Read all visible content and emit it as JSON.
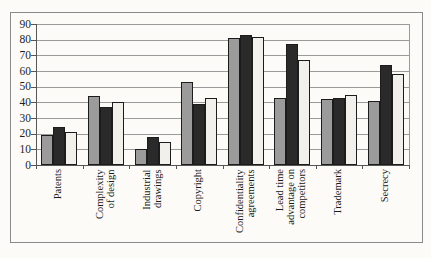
{
  "chart_data": {
    "type": "bar",
    "title": "",
    "xlabel": "",
    "ylabel": "",
    "ylim": [
      0,
      90
    ],
    "ytick_step": 10,
    "yticks": [
      90,
      80,
      70,
      60,
      50,
      40,
      30,
      20,
      10,
      0
    ],
    "grid": true,
    "legend": "none",
    "categories": [
      {
        "label": "Patents",
        "text": "Patents"
      },
      {
        "label": "Complexity of design",
        "text": "Complexity\nof design"
      },
      {
        "label": "Industrial drawings",
        "text": "Industrial\ndrawings"
      },
      {
        "label": "Copyright",
        "text": "Copyright"
      },
      {
        "label": "Confidentiality agreements",
        "text": "Confidentiality\nagreements"
      },
      {
        "label": "Lead time advantage on competitors",
        "text": "Lead time\nadvantage on\ncompetitors"
      },
      {
        "label": "Trademark",
        "text": "Trademark"
      },
      {
        "label": "Secrecy",
        "text": "Secrecy"
      }
    ],
    "series": [
      {
        "name": "series-gray",
        "color": "#9b9b9b",
        "values": [
          19,
          44,
          10,
          53,
          81,
          43,
          42,
          41
        ]
      },
      {
        "name": "series-black",
        "color": "#2a2a2a",
        "values": [
          24,
          37,
          18,
          39,
          83,
          77,
          43,
          64
        ]
      },
      {
        "name": "series-light",
        "color": "#f1f0ea",
        "values": [
          21,
          40,
          15,
          43,
          82,
          67,
          45,
          58
        ]
      }
    ]
  },
  "colors": {
    "background": "#fcfbf7",
    "gridline": "#9a9a9a",
    "axis": "#555555",
    "frame": "#8a8a8a",
    "bar_border": "#1c1c1c",
    "text": "#1a1a1a"
  }
}
